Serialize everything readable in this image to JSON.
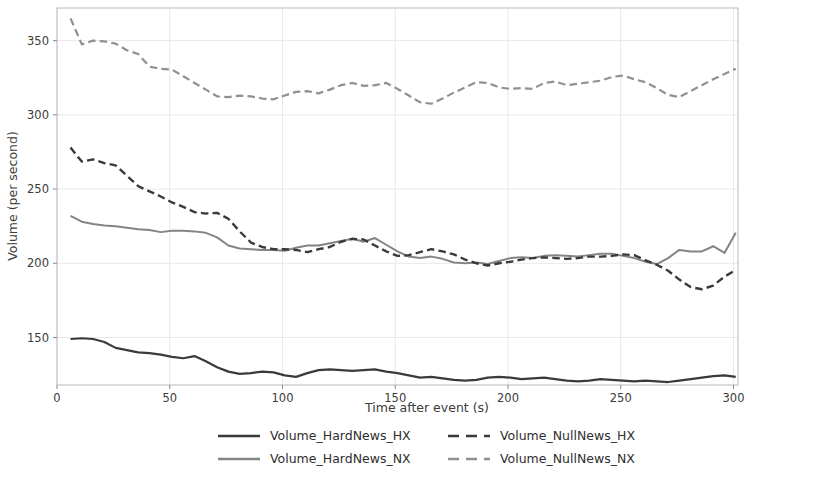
{
  "chart_data": {
    "type": "line",
    "title": "",
    "xlabel": "Time after event (s)",
    "ylabel": "Volume (per second)",
    "xlim": [
      0,
      302
    ],
    "ylim": [
      118,
      372
    ],
    "xticks": [
      0,
      50,
      100,
      150,
      200,
      250,
      300
    ],
    "yticks": [
      150,
      200,
      250,
      300,
      350
    ],
    "grid": true,
    "grid_color": "#e8e8ec",
    "legend_position": "below-axes",
    "legend_columns": 2,
    "x": [
      6,
      11,
      16,
      21,
      26,
      31,
      36,
      41,
      46,
      51,
      56,
      61,
      66,
      71,
      76,
      81,
      86,
      91,
      96,
      101,
      106,
      111,
      116,
      121,
      126,
      131,
      136,
      141,
      146,
      151,
      156,
      161,
      166,
      171,
      176,
      181,
      186,
      191,
      196,
      201,
      206,
      211,
      216,
      221,
      226,
      231,
      236,
      241,
      246,
      251,
      256,
      261,
      266,
      271,
      276,
      281,
      286,
      291,
      296,
      301
    ],
    "series": [
      {
        "name": "Volume_HardNews_HX",
        "style": "solid",
        "color": "#3a3a3a",
        "linewidth": 2.2,
        "values": [
          149,
          149.5,
          149,
          147,
          143,
          141.5,
          140,
          139.5,
          138.5,
          137,
          136,
          137.5,
          134,
          130,
          127,
          125.5,
          126,
          127,
          126.5,
          124.5,
          123.5,
          126,
          128,
          128.5,
          128,
          127.5,
          128,
          128.5,
          127,
          126,
          124.5,
          123,
          123.5,
          122.5,
          121.5,
          121,
          121.5,
          123,
          123.5,
          123,
          122,
          122.5,
          123,
          122,
          121,
          120.5,
          121,
          122,
          121.5,
          121,
          120.5,
          121,
          120.5,
          120,
          121,
          122,
          123,
          124,
          124.5,
          123.5
        ]
      },
      {
        "name": "Volume_HardNews_NX",
        "style": "solid",
        "color": "#848484",
        "linewidth": 2.0,
        "values": [
          232,
          228,
          226.5,
          225.5,
          225,
          224,
          223,
          222.5,
          221,
          222,
          222,
          221.5,
          220.5,
          217.5,
          212,
          210,
          209.5,
          209,
          209,
          208.5,
          210.5,
          212,
          212,
          213.5,
          215,
          216.5,
          214.5,
          217,
          212.5,
          208,
          204.5,
          203.5,
          204.5,
          203,
          200.5,
          200,
          200.5,
          199.5,
          201.5,
          203.5,
          204,
          203.5,
          205,
          205.5,
          205,
          204.5,
          205.5,
          206.5,
          206.5,
          205,
          203.5,
          201,
          199.5,
          203.5,
          209,
          208,
          208,
          211.5,
          207,
          220.5
        ]
      },
      {
        "name": "Volume_NullNews_HX",
        "style": "dashed",
        "color": "#3a3a3a",
        "linewidth": 2.4,
        "values": [
          278,
          268.5,
          270,
          267.5,
          266,
          259,
          252,
          248.5,
          245,
          241,
          238,
          234.5,
          233.5,
          234,
          230,
          221.5,
          214,
          211,
          209.5,
          209.5,
          209,
          207.5,
          209.5,
          211,
          214.5,
          216.5,
          216,
          212,
          208,
          205,
          205.5,
          207.5,
          209.5,
          208,
          206,
          202.5,
          200,
          198.5,
          200,
          201,
          202.5,
          203.5,
          204,
          203.5,
          203,
          203.5,
          204.5,
          204.5,
          205,
          206,
          205.5,
          202,
          199,
          195,
          189,
          184,
          182.5,
          185,
          191,
          195.5
        ]
      },
      {
        "name": "Volume_NullNews_NX",
        "style": "dashed",
        "color": "#909090",
        "linewidth": 2.2,
        "values": [
          365,
          347.5,
          350,
          349.5,
          348,
          343.5,
          341,
          332.5,
          331,
          330.5,
          326,
          321.5,
          317,
          312.5,
          312,
          313,
          312.5,
          311,
          310.5,
          313,
          315.5,
          316,
          314.5,
          317,
          320,
          321.5,
          319.5,
          320,
          321.5,
          317.5,
          313,
          308.5,
          307.5,
          311,
          315,
          318.5,
          322,
          321.5,
          318.5,
          317.5,
          318,
          317.5,
          321.5,
          322.5,
          320,
          321,
          322,
          323,
          325.5,
          326.5,
          324,
          322,
          318,
          313.5,
          312,
          316,
          320,
          324,
          327.5,
          331
        ]
      }
    ]
  },
  "legend": {
    "entries": [
      {
        "label": "Volume_HardNews_HX",
        "style": "solid",
        "color": "#3a3a3a"
      },
      {
        "label": "Volume_NullNews_HX",
        "style": "dashed",
        "color": "#3a3a3a"
      },
      {
        "label": "Volume_HardNews_NX",
        "style": "solid",
        "color": "#848484"
      },
      {
        "label": "Volume_NullNews_NX",
        "style": "dashed",
        "color": "#909090"
      }
    ]
  },
  "axes": {
    "x_label": "Time after event (s)",
    "y_label": "Volume (per second)",
    "x_tick_labels": [
      "0",
      "50",
      "100",
      "150",
      "200",
      "250",
      "300"
    ],
    "y_tick_labels": [
      "150",
      "200",
      "250",
      "300",
      "350"
    ]
  }
}
